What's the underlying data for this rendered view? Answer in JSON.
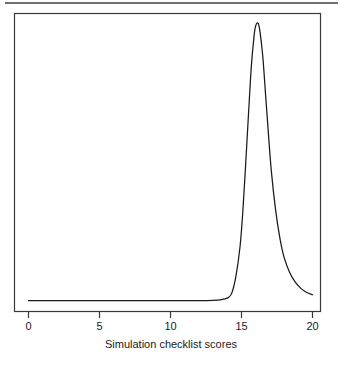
{
  "figure": {
    "background_color": "#ffffff",
    "top_rule_color": "#6f6f6f",
    "axis_color": "#3a3a3a",
    "curve_color": "#1a1a1a",
    "width": 342,
    "height": 367
  },
  "chart_data": {
    "type": "line",
    "title": "",
    "subtitle": "",
    "xlabel": "Simulation checklist scores",
    "ylabel": "",
    "xlim": [
      0,
      20
    ],
    "ylim": [
      0,
      1
    ],
    "xticks": [
      0,
      5,
      10,
      15,
      20
    ],
    "xtick_labels": [
      "0",
      "5",
      "10",
      "15",
      "20"
    ],
    "yticks": [],
    "ytick_labels": [],
    "grid": false,
    "legend": null,
    "annotations": [],
    "series": [
      {
        "name": "density",
        "description": "Kernel density estimate of simulation checklist scores; flat near zero from 0 to about 14, a sharp narrow right-skewed peak centred near 16.2, decaying to near zero by 20.",
        "x": [
          0.0,
          1.0,
          2.0,
          3.0,
          4.0,
          5.0,
          6.0,
          7.0,
          8.0,
          9.0,
          10.0,
          11.0,
          12.0,
          13.0,
          13.5,
          14.0,
          14.3,
          14.6,
          14.9,
          15.1,
          15.3,
          15.5,
          15.7,
          15.9,
          16.0,
          16.1,
          16.2,
          16.3,
          16.5,
          16.7,
          16.9,
          17.1,
          17.4,
          17.7,
          18.0,
          18.4,
          18.8,
          19.2,
          19.6,
          20.0
        ],
        "y": [
          0.005,
          0.005,
          0.005,
          0.005,
          0.005,
          0.005,
          0.005,
          0.005,
          0.005,
          0.005,
          0.005,
          0.005,
          0.005,
          0.006,
          0.008,
          0.014,
          0.03,
          0.09,
          0.2,
          0.33,
          0.5,
          0.68,
          0.85,
          0.96,
          0.99,
          1.0,
          0.995,
          0.97,
          0.88,
          0.74,
          0.6,
          0.47,
          0.33,
          0.23,
          0.16,
          0.105,
          0.07,
          0.048,
          0.034,
          0.026
        ]
      }
    ]
  },
  "axis": {
    "tick_0": "0",
    "tick_5": "5",
    "tick_10": "10",
    "tick_15": "15",
    "tick_20": "20",
    "x_title": "Simulation checklist scores"
  }
}
